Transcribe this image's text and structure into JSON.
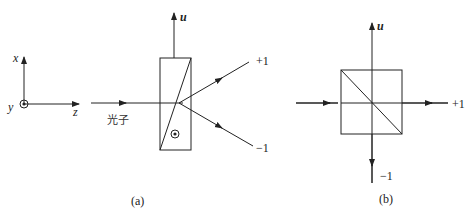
{
  "panel_a": {
    "caption": "(a)",
    "axes": {
      "x_label": "x",
      "y_label": "y",
      "z_label": "z"
    },
    "photon_label": "光子",
    "u_label": "u",
    "plus_label": "+1",
    "minus_label": "−1"
  },
  "panel_b": {
    "caption": "(b)",
    "u_label": "u",
    "plus_label": "+1",
    "minus_label": "−1"
  },
  "colors": {
    "stroke": "#222222",
    "background": "#ffffff"
  }
}
